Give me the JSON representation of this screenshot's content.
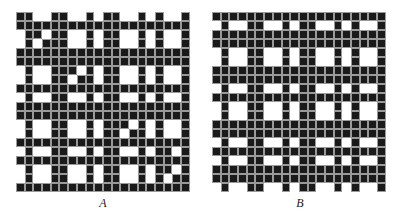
{
  "figure": {
    "panels": [
      {
        "label": "A",
        "cols": 20,
        "rows": [
          "11001100101100101001",
          "11111111111111111111",
          "01101100101100101001",
          "01011100101100101001",
          "11111111111111111111",
          "11111111111111111111",
          "01001110101100101001",
          "01001101101100101001",
          "11111111111111111111",
          "01001100101100101001",
          "11111111111111111111",
          "11111111111111111111",
          "01001100101110101001",
          "01001100101101101001",
          "11111111111111111111",
          "01001100101100101101",
          "11111111111111111111",
          "01001100101100101101",
          "01001100101100101011",
          "11111111111111111111"
        ]
      },
      {
        "label": "B",
        "cols": 20,
        "rows": [
          "11111111111111111111",
          "01001100101100101001",
          "11111111111111111111",
          "11111111111111111111",
          "01001100101100101001",
          "01001100101100101001",
          "11111111111111111111",
          "11111111111111111111",
          "01001100101100101001",
          "11111111111111111111",
          "01001100101100101001",
          "01001100101100101001",
          "11111111111111111111",
          "11111111111111111111",
          "01001100101100101001",
          "11111111111111111111",
          "01001100101100101001",
          "11111111111111111111",
          "11111111111111111111",
          "01001100101100101001"
        ]
      }
    ],
    "colors": {
      "filled": "#1a1a1a",
      "empty": "#ffffff"
    }
  }
}
